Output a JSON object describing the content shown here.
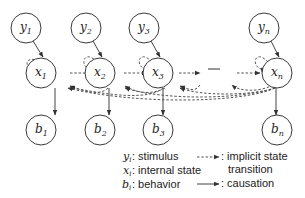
{
  "nodes": {
    "stimulus": [
      {
        "base": "y",
        "sub": "1"
      },
      {
        "base": "y",
        "sub": "2"
      },
      {
        "base": "y",
        "sub": "3"
      },
      {
        "base": "y",
        "sub": "n"
      }
    ],
    "state": [
      {
        "base": "x",
        "sub": "1"
      },
      {
        "base": "x",
        "sub": "2"
      },
      {
        "base": "x",
        "sub": "3"
      },
      {
        "base": "x",
        "sub": "n"
      }
    ],
    "behavior": [
      {
        "base": "b",
        "sub": "1"
      },
      {
        "base": "b",
        "sub": "2"
      },
      {
        "base": "b",
        "sub": "3"
      },
      {
        "base": "b",
        "sub": "n"
      }
    ]
  },
  "legend": {
    "items": [
      {
        "symbol": "y",
        "sub": "i",
        "text": ": stimulus"
      },
      {
        "symbol": "x",
        "sub": "i",
        "text": ": internal state"
      },
      {
        "symbol": "b",
        "sub": "i",
        "text": ": behavior"
      }
    ],
    "edge_types": [
      {
        "style": "dashed",
        "text_line1": ": implicit state",
        "text_line2": "transition"
      },
      {
        "style": "solid",
        "text_line1": ": causation"
      }
    ]
  }
}
